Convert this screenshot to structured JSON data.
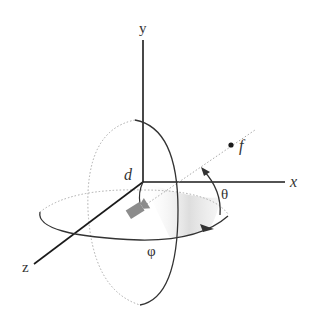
{
  "diagram": {
    "type": "3d-camera-orbit",
    "labels": {
      "y_axis": "y",
      "x_axis": "x",
      "z_axis": "z",
      "distance": "d",
      "focus": "f",
      "elevation": "θ",
      "azimuth": "φ"
    },
    "colors": {
      "axis": "#1a1a1a",
      "orbit": "#333333",
      "dotted": "#aaaaaa",
      "camera": "#8c8c8c",
      "shade": "#bfbfbf"
    }
  }
}
